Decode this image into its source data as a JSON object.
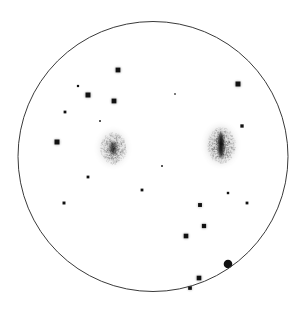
{
  "page": {
    "background_color": "#ffffff",
    "width": 306,
    "height": 314
  },
  "field_of_view": {
    "label": "eyepiece-field-circle",
    "center_x": 153,
    "center_y": 156.5,
    "radius": 135,
    "stroke_color": "#3a3a3a",
    "stroke_width": 1.0,
    "fill": "none"
  },
  "chart_data": {
    "type": "scatter",
    "title": "",
    "xlabel": "",
    "ylabel": "",
    "xlim": [
      0,
      306
    ],
    "ylim": [
      0,
      314
    ],
    "grid": false,
    "legend": "none",
    "annotations": [],
    "star_color": "#111111",
    "nebula_color": "#555555",
    "series": [
      {
        "name": "stars",
        "symbol": "filled-square",
        "points": [
          {
            "x": 118,
            "y": 70,
            "r": 2.6,
            "mag": "bright"
          },
          {
            "x": 78,
            "y": 86,
            "r": 1.2,
            "mag": "faint"
          },
          {
            "x": 88,
            "y": 95,
            "r": 2.7,
            "mag": "bright"
          },
          {
            "x": 114,
            "y": 101,
            "r": 2.6,
            "mag": "bright"
          },
          {
            "x": 238,
            "y": 84,
            "r": 2.7,
            "mag": "bright"
          },
          {
            "x": 65,
            "y": 112,
            "r": 1.5,
            "mag": "faint"
          },
          {
            "x": 242,
            "y": 126,
            "r": 1.8,
            "mag": "medium"
          },
          {
            "x": 57,
            "y": 142,
            "r": 2.7,
            "mag": "bright"
          },
          {
            "x": 88,
            "y": 177,
            "r": 1.5,
            "mag": "faint"
          },
          {
            "x": 142,
            "y": 190,
            "r": 1.5,
            "mag": "faint"
          },
          {
            "x": 228,
            "y": 193,
            "r": 1.3,
            "mag": "faint"
          },
          {
            "x": 200,
            "y": 205,
            "r": 2.1,
            "mag": "medium"
          },
          {
            "x": 247,
            "y": 203,
            "r": 1.5,
            "mag": "faint"
          },
          {
            "x": 64,
            "y": 203,
            "r": 1.6,
            "mag": "faint"
          },
          {
            "x": 204,
            "y": 226,
            "r": 2.3,
            "mag": "medium"
          },
          {
            "x": 186,
            "y": 236,
            "r": 2.5,
            "mag": "bright"
          },
          {
            "x": 228,
            "y": 264,
            "r": 4.3,
            "mag": "brightest"
          },
          {
            "x": 199,
            "y": 278,
            "r": 2.5,
            "mag": "bright"
          },
          {
            "x": 190,
            "y": 288,
            "r": 2.0,
            "mag": "medium"
          },
          {
            "x": 100,
            "y": 121,
            "r": 0.9,
            "mag": "very-faint"
          },
          {
            "x": 162,
            "y": 166,
            "r": 0.9,
            "mag": "very-faint"
          },
          {
            "x": 175,
            "y": 94,
            "r": 0.8,
            "mag": "very-faint"
          }
        ]
      },
      {
        "name": "deep-sky-objects",
        "symbol": "diffuse-blob",
        "points": [
          {
            "label": "faint-nebula-left",
            "x": 113,
            "y": 148,
            "rx": 13,
            "ry": 16,
            "core_rx": 4,
            "core_ry": 7,
            "opacity": 0.38,
            "core_opacity": 0.55,
            "brightness": "faint"
          },
          {
            "label": "edge-on-galaxy-right",
            "x": 221,
            "y": 145,
            "rx": 14,
            "ry": 18,
            "core_rx": 3,
            "core_ry": 13,
            "opacity": 0.45,
            "core_opacity": 0.95,
            "brightness": "bright"
          }
        ]
      }
    ]
  }
}
